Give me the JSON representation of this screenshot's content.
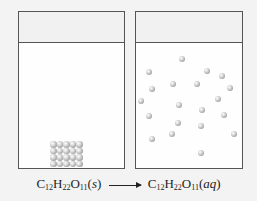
{
  "diagram": {
    "left_beaker": {
      "label": "solid sucrose",
      "block": {
        "rows": 4,
        "cols": 5
      }
    },
    "right_beaker": {
      "label": "dissolved sucrose",
      "molecules": [
        [
          182,
          59
        ],
        [
          149,
          72
        ],
        [
          207,
          71
        ],
        [
          222,
          76
        ],
        [
          152,
          89
        ],
        [
          173,
          84
        ],
        [
          197,
          84
        ],
        [
          230,
          88
        ],
        [
          141,
          101
        ],
        [
          218,
          99
        ],
        [
          179,
          105
        ],
        [
          202,
          110
        ],
        [
          149,
          116
        ],
        [
          224,
          115
        ],
        [
          178,
          123
        ],
        [
          201,
          126
        ],
        [
          172,
          134
        ],
        [
          234,
          134
        ],
        [
          152,
          139
        ],
        [
          201,
          153
        ]
      ]
    },
    "equation": {
      "reactant": {
        "C": "C",
        "c_sub": "12",
        "H": "H",
        "h_sub": "22",
        "O": "O",
        "o_sub": "11",
        "state": "(s)"
      },
      "product": {
        "C": "C",
        "c_sub": "12",
        "H": "H",
        "h_sub": "22",
        "O": "O",
        "o_sub": "11",
        "state": "(aq)"
      },
      "arrow": "right-arrow"
    }
  }
}
